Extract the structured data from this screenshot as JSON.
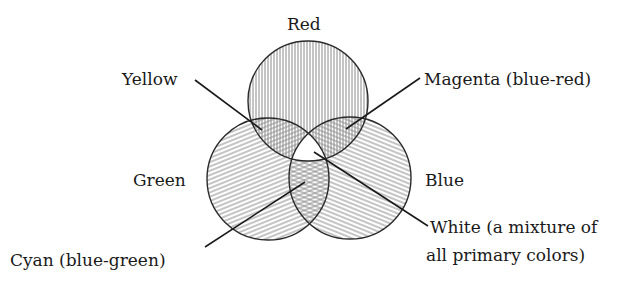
{
  "diagram": {
    "circles": [
      {
        "id": "red",
        "label": "Red",
        "hatch": "vertical"
      },
      {
        "id": "green",
        "label": "Green",
        "hatch": "diagonal-rising"
      },
      {
        "id": "blue",
        "label": "Blue",
        "hatch": "diagonal-falling"
      }
    ],
    "overlaps": [
      {
        "id": "yellow",
        "label": "Yellow",
        "of": [
          "red",
          "green"
        ]
      },
      {
        "id": "magenta",
        "label": "Magenta (blue-red)",
        "of": [
          "red",
          "blue"
        ]
      },
      {
        "id": "cyan",
        "label": "Cyan (blue-green)",
        "of": [
          "green",
          "blue"
        ]
      },
      {
        "id": "white",
        "label_line1": "White (a mixture of",
        "label_line2": "all primary colors)",
        "of": [
          "red",
          "green",
          "blue"
        ]
      }
    ],
    "colors": {
      "ink": "#1a1a1a",
      "hatch": "#8a8a8a",
      "background": "#ffffff"
    }
  }
}
